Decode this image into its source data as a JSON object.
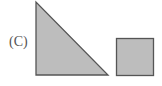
{
  "figure": {
    "label": "(C)",
    "fill_color": "#bdbdbd",
    "stroke_color": "#555555",
    "shapes": [
      {
        "type": "right-triangle",
        "points": "36,2 36,75 108,75"
      },
      {
        "type": "square",
        "x": 116,
        "y": 38,
        "width": 37,
        "height": 37
      }
    ]
  }
}
